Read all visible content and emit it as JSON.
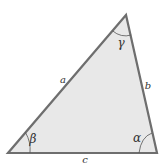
{
  "diagram": {
    "colors": {
      "fill": "#e8e8e8",
      "stroke": "#6e6e6e",
      "arc": "#555555",
      "text": "#333333",
      "background": "#ffffff"
    },
    "vertices": {
      "top": {
        "x": 126,
        "y": 15,
        "angle": "gamma"
      },
      "bottom_left": {
        "x": 8,
        "y": 153,
        "angle": "beta"
      },
      "bottom_right": {
        "x": 157,
        "y": 153,
        "angle": "alpha"
      }
    },
    "sides": {
      "a": {
        "label": "a",
        "between": [
          "bottom_left",
          "top"
        ]
      },
      "b": {
        "label": "b",
        "between": [
          "top",
          "bottom_right"
        ]
      },
      "c": {
        "label": "c",
        "between": [
          "bottom_left",
          "bottom_right"
        ]
      }
    },
    "angles": {
      "alpha": {
        "label": "α",
        "vertex": "bottom_right"
      },
      "beta": {
        "label": "β",
        "vertex": "bottom_left"
      },
      "gamma": {
        "label": "γ",
        "vertex": "top"
      }
    }
  }
}
